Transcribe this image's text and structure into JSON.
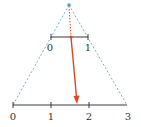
{
  "diagram": {
    "colors": {
      "axis": "#3a3a3a",
      "dashed_rays": "#6fb3d6",
      "apex_point": "#4aa3d8",
      "arrow": "#e0451f"
    },
    "apex": {
      "x": 69,
      "y": 5
    },
    "top_line": {
      "y": 37,
      "x_start": 51,
      "x_end": 88,
      "ticks": [
        {
          "x": 51,
          "label": "0"
        },
        {
          "x": 88,
          "label": "1"
        }
      ]
    },
    "bottom_line": {
      "y": 105,
      "x_start": 13,
      "x_end": 127,
      "ticks": [
        {
          "x": 13,
          "label": "0"
        },
        {
          "x": 51,
          "label": "1"
        },
        {
          "x": 89,
          "label": "2"
        },
        {
          "x": 127,
          "label": "3"
        }
      ]
    },
    "mapped_point": {
      "x": 71,
      "y": 37
    },
    "arrow_end": {
      "x": 77,
      "y": 103
    }
  }
}
